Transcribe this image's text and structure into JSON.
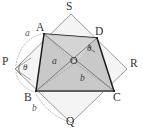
{
  "figure": {
    "kind": "geometry-diagram",
    "colors": {
      "background": "#ffffff",
      "inner_fill": "#c9c9c9",
      "inner_fill_light": "#d4d4d4",
      "inner_stroke": "#1a1a1a",
      "outer_stroke": "#8f8f8f",
      "dashed_stroke": "#b0b0b0",
      "diagonal_stroke": "#7d7d7d",
      "base_stroke": "#6e6e6e",
      "label_color": "#333333"
    },
    "outer_square": {
      "name": "PQRS",
      "vertices": [
        {
          "id": "S",
          "label": "S",
          "x": 71,
          "y": 14
        },
        {
          "id": "R",
          "label": "R",
          "x": 127,
          "y": 69
        },
        {
          "id": "Q",
          "label": "Q",
          "x": 71,
          "y": 123
        },
        {
          "id": "P",
          "label": "P",
          "x": 15,
          "y": 69
        }
      ]
    },
    "inner_quad": {
      "name": "ABCD",
      "vertices": [
        {
          "id": "A",
          "label": "A",
          "x": 44,
          "y": 34
        },
        {
          "id": "D",
          "label": "D",
          "x": 97,
          "y": 38
        },
        {
          "id": "C",
          "label": "C",
          "x": 114,
          "y": 91
        },
        {
          "id": "B",
          "label": "B",
          "x": 36,
          "y": 91
        }
      ]
    },
    "center_point": {
      "id": "O",
      "label": "O",
      "x": 75,
      "y": 63
    },
    "vertex_labels": [
      {
        "text": "S",
        "x": 68,
        "y": 2,
        "class": "lbl-vertex"
      },
      {
        "text": "A",
        "x": 37,
        "y": 23,
        "class": "lbl-vertex"
      },
      {
        "text": "D",
        "x": 95,
        "y": 27,
        "class": "lbl-vertex"
      },
      {
        "text": "P",
        "x": 3,
        "y": 56,
        "class": "lbl-vertex"
      },
      {
        "text": "R",
        "x": 130,
        "y": 59,
        "class": "lbl-vertex"
      },
      {
        "text": "B",
        "x": 25,
        "y": 92,
        "class": "lbl-vertex"
      },
      {
        "text": "C",
        "x": 114,
        "y": 92,
        "class": "lbl-vertex"
      },
      {
        "text": "Q",
        "x": 68,
        "y": 117,
        "class": "lbl-vertex"
      }
    ],
    "side_labels": [
      {
        "id": "a-outer",
        "text": "a",
        "x": 26,
        "y": 31,
        "class": "lbl-side"
      },
      {
        "id": "a-inner",
        "text": "a",
        "x": 53,
        "y": 59,
        "class": "lbl-side-dark"
      },
      {
        "id": "b-inner",
        "text": "b",
        "x": 81,
        "y": 76,
        "class": "lbl-side-dark"
      },
      {
        "id": "b-outer",
        "text": "b",
        "x": 33,
        "y": 107,
        "class": "lbl-side"
      }
    ],
    "angle_labels": [
      {
        "id": "theta-at-p",
        "text": "θ",
        "x": 23,
        "y": 59,
        "class": "lbl-angle"
      },
      {
        "id": "theta-at-d",
        "text": "θ",
        "x": 87,
        "y": 47,
        "class": "lbl-angle"
      }
    ],
    "center_label": {
      "text": "O",
      "x": 71,
      "y": 57
    },
    "geometry_paths": {
      "outer_square_path": "M 71 14 L 127 69 L 71 123 L 15 69 Z",
      "inner_quad_path": "M 44 34 L 97 38 L 114 91 L 36 91 Z",
      "diagonal_AC": "M 44 34 L 114 91",
      "diagonal_BD": "M 36 91 L 97 38",
      "spoke_OA": "M 75 63 L 44 34",
      "spoke_OB": "M 75 63 L 36 91",
      "spoke_OC": "M 75 63 L 114 91",
      "spoke_OD": "M 75 63 L 97 38",
      "arc_PA": "M 15 69 A 46 46 0 0 1 44 34",
      "arc_BQ": "M 36 91 A 46 46 0 0 0 71 123",
      "base_BC": "M 36 91 L 114 91"
    }
  }
}
